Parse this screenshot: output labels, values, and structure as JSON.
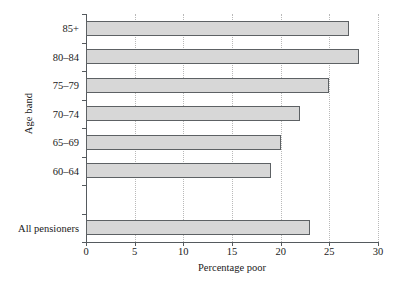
{
  "chart_data": {
    "type": "bar",
    "orientation": "horizontal",
    "title": "",
    "xlabel": "Percentage poor",
    "ylabel": "Age band",
    "categories": [
      "All pensioners",
      "60–64",
      "65–69",
      "70–74",
      "75–79",
      "80–84",
      "85+"
    ],
    "values": [
      23,
      19,
      20,
      22,
      25,
      28,
      27
    ],
    "xlim": [
      0,
      30
    ],
    "xticks": [
      0,
      5,
      10,
      15,
      20,
      25,
      30
    ],
    "xtick_labels": [
      "0",
      "5",
      "10",
      "15",
      "20",
      "25",
      "30"
    ],
    "grid": "vertical-dotted",
    "legend": null,
    "bar_fill": "#d7d7d7",
    "bar_edge": "#5d6164",
    "axis_color": "#555a5e",
    "grid_color": "#b9b9b9",
    "background": "#ffffff",
    "gap_after_category": "All pensioners"
  }
}
